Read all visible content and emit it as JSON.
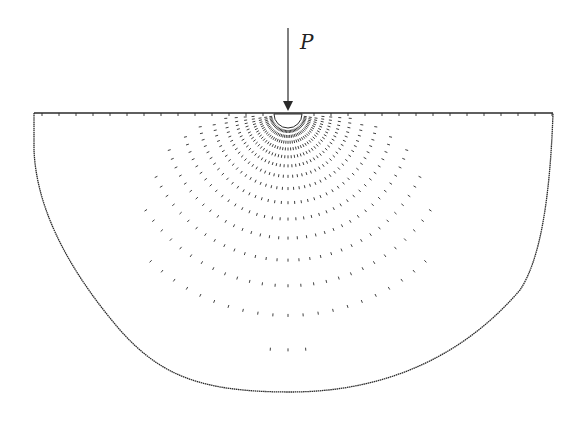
{
  "diagram": {
    "load_label": "P",
    "colors": {
      "ink": "#2a2a2a",
      "background": "#ffffff"
    },
    "surface": {
      "x1": 34,
      "x2": 553,
      "y": 113
    },
    "load": {
      "x": 288,
      "y_top": 28,
      "y_tip": 111,
      "label_x": 300,
      "label_y": 30
    },
    "contact_cavity": {
      "cx": 288,
      "cy": 114,
      "r": 14
    },
    "origin": {
      "x": 288,
      "y": 128
    },
    "rays": {
      "count": 41,
      "angle_min_deg": -86,
      "angle_max_deg": 86
    },
    "boundary": "M34,113 L34,150 C36,200 60,260 120,330 C160,375 200,392 290,392 C380,392 460,360 520,290 C540,260 550,200 553,113"
  }
}
